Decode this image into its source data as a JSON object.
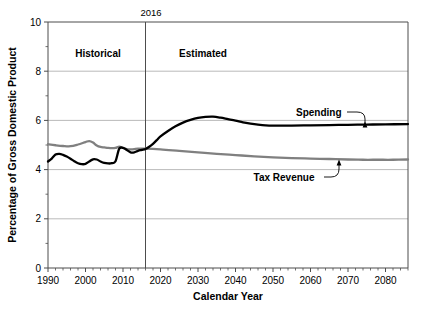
{
  "chart_data": {
    "type": "line",
    "title": "",
    "xlabel": "Calendar Year",
    "ylabel": "Percentage of Gross Domestic Product",
    "xlim": [
      1990,
      2086
    ],
    "ylim": [
      0,
      10
    ],
    "xticks": [
      1990,
      2000,
      2010,
      2020,
      2030,
      2040,
      2050,
      2060,
      2070,
      2080
    ],
    "xtick_labels": [
      "1990",
      "2000",
      "2010",
      "2020",
      "2030",
      "2040",
      "2050",
      "2060",
      "2070",
      "2080"
    ],
    "yticks": [
      0,
      2,
      4,
      6,
      8,
      10
    ],
    "ytick_labels": [
      "0",
      "2",
      "4",
      "6",
      "8",
      "10"
    ],
    "minor_xtick_interval": 2,
    "minor_ytick_interval": 1,
    "grid": "horizontal-major",
    "legend": "inline-annotations",
    "divider": {
      "x": 2016,
      "label": "2016",
      "left_region_label": "Historical",
      "right_region_label": "Estimated"
    },
    "series": [
      {
        "name": "Spending",
        "color": "#000000",
        "width": 2.3,
        "label_x": 2062,
        "label_y": 6.75,
        "points": [
          [
            1990,
            4.33
          ],
          [
            1991,
            4.45
          ],
          [
            1992,
            4.61
          ],
          [
            1993,
            4.64
          ],
          [
            1994,
            4.6
          ],
          [
            1995,
            4.53
          ],
          [
            1996,
            4.44
          ],
          [
            1997,
            4.34
          ],
          [
            1998,
            4.26
          ],
          [
            1999,
            4.22
          ],
          [
            2000,
            4.23
          ],
          [
            2001,
            4.33
          ],
          [
            2002,
            4.42
          ],
          [
            2003,
            4.41
          ],
          [
            2004,
            4.33
          ],
          [
            2005,
            4.27
          ],
          [
            2006,
            4.25
          ],
          [
            2007,
            4.26
          ],
          [
            2008,
            4.34
          ],
          [
            2009,
            4.85
          ],
          [
            2010,
            4.88
          ],
          [
            2011,
            4.8
          ],
          [
            2012,
            4.7
          ],
          [
            2013,
            4.7
          ],
          [
            2014,
            4.76
          ],
          [
            2015,
            4.8
          ],
          [
            2016,
            4.84
          ],
          [
            2017,
            4.93
          ],
          [
            2018,
            5.05
          ],
          [
            2019,
            5.2
          ],
          [
            2020,
            5.35
          ],
          [
            2022,
            5.57
          ],
          [
            2024,
            5.76
          ],
          [
            2026,
            5.91
          ],
          [
            2028,
            6.02
          ],
          [
            2030,
            6.1
          ],
          [
            2032,
            6.14
          ],
          [
            2034,
            6.15
          ],
          [
            2036,
            6.11
          ],
          [
            2038,
            6.05
          ],
          [
            2040,
            5.99
          ],
          [
            2042,
            5.92
          ],
          [
            2044,
            5.87
          ],
          [
            2046,
            5.83
          ],
          [
            2048,
            5.8
          ],
          [
            2050,
            5.79
          ],
          [
            2055,
            5.79
          ],
          [
            2060,
            5.8
          ],
          [
            2065,
            5.81
          ],
          [
            2070,
            5.82
          ],
          [
            2075,
            5.83
          ],
          [
            2080,
            5.84
          ],
          [
            2086,
            5.85
          ]
        ]
      },
      {
        "name": "Tax Revenue",
        "color": "#808080",
        "width": 2.3,
        "label_x": 2052,
        "label_y": 3.62,
        "points": [
          [
            1990,
            5.03
          ],
          [
            1992,
            4.99
          ],
          [
            1994,
            4.96
          ],
          [
            1996,
            4.95
          ],
          [
            1998,
            5.02
          ],
          [
            2000,
            5.12
          ],
          [
            2001,
            5.16
          ],
          [
            2002,
            5.1
          ],
          [
            2003,
            4.98
          ],
          [
            2004,
            4.92
          ],
          [
            2005,
            4.9
          ],
          [
            2006,
            4.88
          ],
          [
            2007,
            4.87
          ],
          [
            2008,
            4.88
          ],
          [
            2009,
            4.93
          ],
          [
            2010,
            4.88
          ],
          [
            2011,
            4.83
          ],
          [
            2012,
            4.82
          ],
          [
            2013,
            4.83
          ],
          [
            2014,
            4.85
          ],
          [
            2016,
            4.85
          ],
          [
            2020,
            4.82
          ],
          [
            2025,
            4.76
          ],
          [
            2030,
            4.7
          ],
          [
            2035,
            4.64
          ],
          [
            2040,
            4.59
          ],
          [
            2045,
            4.54
          ],
          [
            2050,
            4.5
          ],
          [
            2055,
            4.47
          ],
          [
            2060,
            4.45
          ],
          [
            2065,
            4.43
          ],
          [
            2070,
            4.41
          ],
          [
            2074,
            4.4
          ],
          [
            2078,
            4.4
          ],
          [
            2082,
            4.4
          ],
          [
            2086,
            4.41
          ]
        ]
      }
    ]
  },
  "axes": {
    "x_axis_title": "Calendar Year",
    "y_axis_title": "Percentage of Gross Domestic Product"
  },
  "annotations": {
    "divider_year": "2016",
    "historical": "Historical",
    "estimated": "Estimated",
    "spending": "Spending",
    "tax_revenue": "Tax Revenue"
  },
  "colors": {
    "spending": "#000000",
    "tax_revenue": "#808080",
    "grid": "#a8a8a8",
    "axis": "#4d4d4d",
    "background": "#ffffff"
  }
}
